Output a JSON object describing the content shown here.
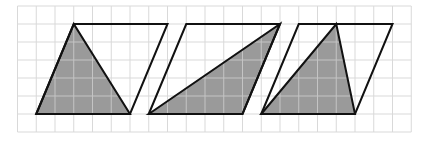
{
  "grid": {
    "origin_x": 17.5,
    "origin_y": 6,
    "cell_w": 18.75,
    "cell_h": 18,
    "cols": 21,
    "rows": 7,
    "line_color": "#d9d9d9",
    "line_color_on_fill": "#c4c4c4"
  },
  "style": {
    "fill": "#9a9a9a",
    "stroke": "#111111",
    "stroke_width": 2
  },
  "shapes": [
    {
      "name": "shape-1",
      "parallelogram": [
        [
          1,
          6
        ],
        [
          3,
          1
        ],
        [
          8,
          1
        ],
        [
          6,
          6
        ]
      ],
      "triangle": [
        [
          1,
          6
        ],
        [
          3,
          1
        ],
        [
          6,
          6
        ]
      ]
    },
    {
      "name": "shape-2",
      "parallelogram": [
        [
          7,
          6
        ],
        [
          9,
          1
        ],
        [
          14,
          1
        ],
        [
          12,
          6
        ]
      ],
      "triangle": [
        [
          7,
          6
        ],
        [
          14,
          1
        ],
        [
          12,
          6
        ]
      ]
    },
    {
      "name": "shape-3",
      "parallelogram": [
        [
          13,
          6
        ],
        [
          15,
          1
        ],
        [
          20,
          1
        ],
        [
          18,
          6
        ]
      ],
      "triangle": [
        [
          13,
          6
        ],
        [
          17,
          1
        ],
        [
          18,
          6
        ]
      ]
    }
  ]
}
